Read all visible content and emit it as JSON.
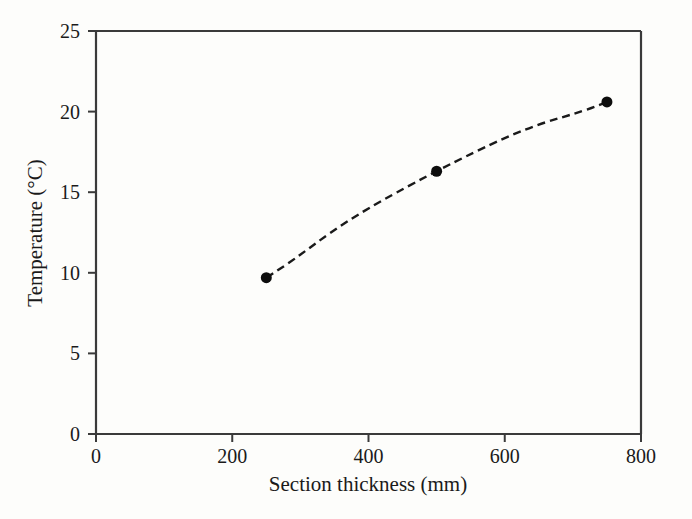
{
  "chart_data": {
    "type": "line",
    "title": "",
    "subtitle": "",
    "xlabel": "Section thickness (mm)",
    "ylabel": "Temperature (°C)",
    "xlim": [
      0,
      800
    ],
    "ylim": [
      0,
      25
    ],
    "xticks": [
      0,
      200,
      400,
      600,
      800
    ],
    "yticks": [
      0,
      5,
      10,
      15,
      20,
      25
    ],
    "xtick_labels": [
      "0",
      "200",
      "400",
      "600",
      "800"
    ],
    "ytick_labels": [
      "0",
      "5",
      "10",
      "15",
      "20",
      "25"
    ],
    "grid": false,
    "legend": "none",
    "series": [
      {
        "name": "Temperature vs section thickness",
        "x": [
          250,
          500,
          750
        ],
        "values": [
          9.7,
          16.3,
          20.6
        ],
        "line_style": "dashed",
        "line_color": "#1a1a1a",
        "marker": "circle",
        "marker_color": "#0d0d0d",
        "marker_size_px": 11,
        "interpolation": "smooth-concave-down"
      }
    ],
    "annotations": [],
    "colors": {
      "background": "#fdfdfb",
      "axis": "#3a3a3a",
      "data": "#0d0d0d"
    }
  },
  "axes": {
    "ytick_positions_px": [
      434,
      353.4,
      272.8,
      192.2,
      111.6,
      31
    ],
    "xtick_positions_px": [
      96,
      232.25,
      368.5,
      504.75,
      641
    ]
  }
}
